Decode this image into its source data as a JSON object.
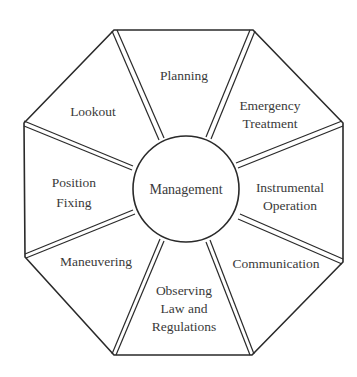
{
  "diagram": {
    "type": "octagon-wheel",
    "center": {
      "label": "Management"
    },
    "segments": [
      {
        "id": "planning",
        "lines": [
          "Planning"
        ]
      },
      {
        "id": "emergency-treatment",
        "lines": [
          "Emergency",
          "Treatment"
        ]
      },
      {
        "id": "instrumental-operation",
        "lines": [
          "Instrumental",
          "Operation"
        ]
      },
      {
        "id": "communication",
        "lines": [
          "Communication"
        ]
      },
      {
        "id": "observing-law-and-regulations",
        "lines": [
          "Observing",
          "Law and",
          "Regulations"
        ]
      },
      {
        "id": "maneuvering",
        "lines": [
          "Maneuvering"
        ]
      },
      {
        "id": "position-fixing",
        "lines": [
          "Position",
          "Fixing"
        ]
      },
      {
        "id": "lookout",
        "lines": [
          "Lookout"
        ]
      }
    ],
    "colors": {
      "stroke": "#2a2a2a",
      "text": "#3a3a3a",
      "background": "#ffffff"
    }
  }
}
